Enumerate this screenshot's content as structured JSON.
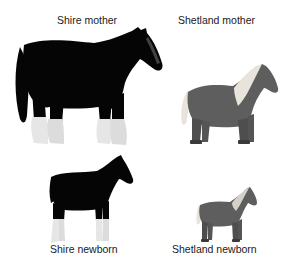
{
  "figure": {
    "panels": [
      {
        "id": "shire-mother",
        "label": "Shire mother",
        "body_color": "#050505",
        "feather_color": "#e6e6e6"
      },
      {
        "id": "shetland-mother",
        "label": "Shetland mother",
        "body_color": "#5e5e5e",
        "mane_color": "#e8e4dc"
      },
      {
        "id": "shire-newborn",
        "label": "Shire newborn",
        "body_color": "#050505",
        "feather_color": "#e6e6e6"
      },
      {
        "id": "shetland-newborn",
        "label": "Shetland newborn",
        "body_color": "#5e5e5e",
        "mane_color": "#e8e4dc"
      }
    ]
  }
}
